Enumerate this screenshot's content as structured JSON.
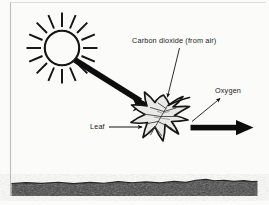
{
  "figure": {
    "type": "photosynthesis-diagram",
    "background_color": "#fbfbfa",
    "ink_color": "#111111",
    "labels": {
      "carbon_dioxide": "Carbon dioxide (from air)",
      "oxygen": "Oxygen",
      "leaf": "Leaf"
    },
    "elements": {
      "sun": {
        "name": "sun",
        "center_x": 62,
        "center_y": 48,
        "radius": 17,
        "ray_count": 16,
        "ray_inner": 21,
        "ray_outer": 34
      },
      "sunlight_arrow": {
        "name": "sunlight-arrow",
        "from_x": 78,
        "from_y": 60,
        "to_x": 146,
        "to_y": 103,
        "style": "thick-solid-black"
      },
      "oxygen_arrow": {
        "name": "oxygen-output-arrow",
        "from_x": 192,
        "from_y": 128,
        "to_x": 252,
        "to_y": 128,
        "style": "thick-solid-black"
      },
      "oxygen_pointer": {
        "name": "oxygen-pointer-arrow",
        "from_x": 193,
        "from_y": 120,
        "to_x": 221,
        "to_y": 98,
        "style": "thin-line-arrow"
      },
      "co2_pointer": {
        "name": "carbon-dioxide-pointer-arrow",
        "from_x": 179,
        "from_y": 49,
        "to_x": 168,
        "to_y": 98,
        "style": "thin-line-arrow"
      },
      "leaf_pointer": {
        "name": "leaf-pointer-arrow",
        "from_x": 110,
        "from_y": 127,
        "to_x": 142,
        "to_y": 127,
        "style": "thin-line-arrow"
      },
      "leaf": {
        "name": "maple-leaf",
        "center_x": 163,
        "center_y": 125,
        "fill": "#e8e8e6",
        "outline": "#151515",
        "vein_color": "#3a3a3a"
      },
      "ground": {
        "name": "ground-band",
        "top_y": 180,
        "bottom_y": 196,
        "left_x": 11,
        "right_x": 258,
        "fill": "#3d3d3d"
      },
      "frame": {
        "name": "page-border",
        "left_x": 10,
        "top_y": 2,
        "bottom_y": 196,
        "color": "#b8b8b8"
      }
    }
  }
}
